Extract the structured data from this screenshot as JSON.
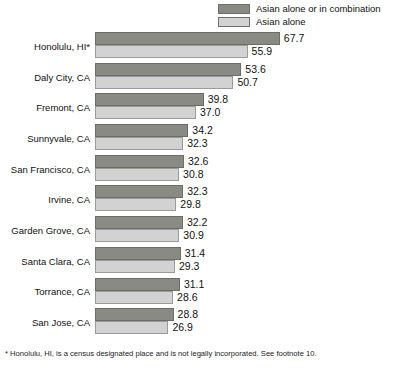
{
  "legend": {
    "items": [
      {
        "label": "Asian alone or in combination",
        "swatch": "dark",
        "color": "#8a8a85"
      },
      {
        "label": "Asian alone",
        "swatch": "light",
        "color": "#d2d2d2"
      }
    ]
  },
  "footnote": "* Honolulu, HI, is a census designated place and is not legally incorporated.  See footnote 10.",
  "chart_data": {
    "type": "bar",
    "orientation": "horizontal",
    "title": "",
    "xlabel": "",
    "ylabel": "",
    "xlim": [
      0,
      70
    ],
    "grid": false,
    "legend_position": "top-right",
    "categories": [
      "Honolulu, HI*",
      "Daly City, CA",
      "Fremont, CA",
      "Sunnyvale, CA",
      "San Francisco, CA",
      "Irvine, CA",
      "Garden Grove, CA",
      "Santa Clara, CA",
      "Torrance, CA",
      "San Jose, CA"
    ],
    "series": [
      {
        "name": "Asian alone or in combination",
        "color": "#8a8a85",
        "values": [
          67.7,
          53.6,
          39.8,
          34.2,
          32.6,
          32.3,
          32.2,
          31.4,
          31.1,
          28.8
        ]
      },
      {
        "name": "Asian alone",
        "color": "#d2d2d2",
        "values": [
          55.9,
          50.7,
          37.0,
          32.3,
          30.8,
          29.8,
          30.9,
          29.3,
          28.6,
          26.9
        ]
      }
    ]
  }
}
